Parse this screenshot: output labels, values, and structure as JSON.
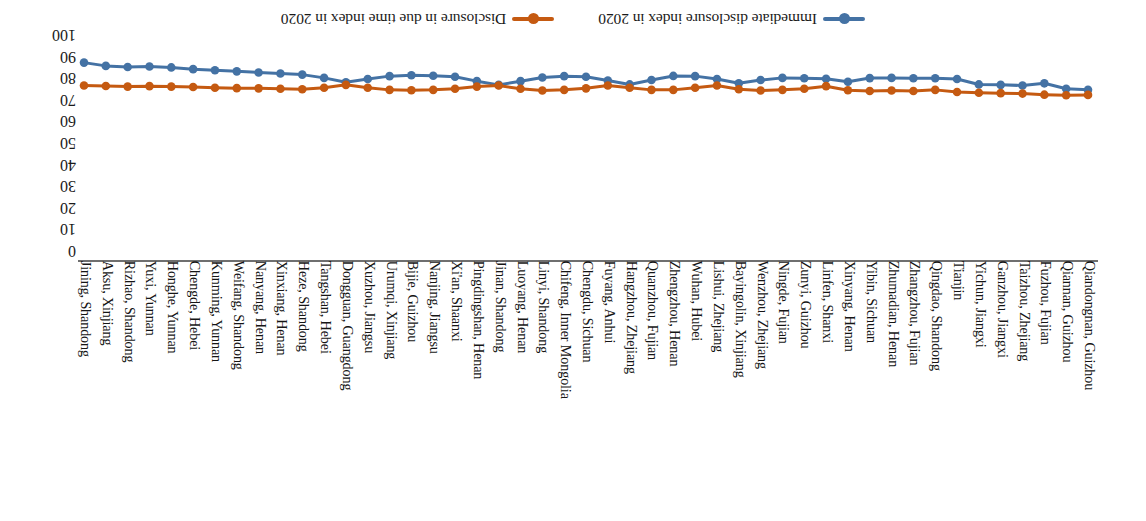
{
  "figure": {
    "rotation_degrees": 180,
    "background": "#ffffff"
  },
  "legend": {
    "position": "bottom",
    "entries": [
      {
        "label": "Immediate disclosure index in 2020",
        "color": "#4472A4",
        "marker": "circle-line-marker"
      },
      {
        "label": "Disclosure in due time index in 2020",
        "color": "#C55A11",
        "marker": "circle-line-marker"
      }
    ]
  },
  "axes": {
    "y": {
      "ticks": [
        "0",
        "10",
        "20",
        "30",
        "40",
        "50",
        "60",
        "70",
        "80",
        "90",
        "100"
      ],
      "min": 0,
      "max": 100,
      "step": 10,
      "position": "right",
      "label": ""
    },
    "x": {
      "label": "",
      "grid": false
    }
  },
  "chart_data": {
    "type": "line",
    "title": "",
    "xlabel": "",
    "ylabel": "",
    "ylim": [
      0,
      100
    ],
    "grid": false,
    "legend_position": "bottom",
    "categories": [
      "Qiandongnan, Guizhou",
      "Qiannan, Guizhou",
      "Fuzhou, Fujian",
      "Taizhou, Zhejiang",
      "Ganzhou, Jiangxi",
      "Yichun, Jiangxi",
      "Tianjin",
      "Qingdao, Shandong",
      "Zhangzhou, Fujian",
      "Zhumadian, Henan",
      "Yibin, Sichuan",
      "Xinyang, Henan",
      "Linfen, Shanxi",
      "Zunyi, Guizhou",
      "Ningde, Fujian",
      "Wenzhou, Zhejiang",
      "Bayingolin, Xinjiang",
      "Lishui, Zhejiang",
      "Wuhan, Hubei",
      "Zhengzhou, Henan",
      "Quanzhou, Fujian",
      "Hangzhou, Zhejiang",
      "Fuyang, Anhui",
      "Chengdu, Sichuan",
      "Chifeng, Inner Mongolia",
      "Linyi, Shandong",
      "Luoyang, Henan",
      "Jinan, Shandong",
      "Pingdingshan, Henan",
      "Xi'an, Shaanxi",
      "Nanjing, Jiangsu",
      "Bijie, Guizhou",
      "Urumqi, Xinjiang",
      "Xuzhou, Jiangsu",
      "Dongguan, Guangdong",
      "Tangshan, Hebei",
      "Heze, Shandong",
      "Xinxiang, Henan",
      "Nanyang, Henan",
      "Weifang, Shandong",
      "Kunming, Yunnan",
      "Chengde, Hebei",
      "Honghe, Yunnan",
      "Yuxi, Yunnan",
      "Rizhao, Shandong",
      "Aksu, Xinjiang",
      "Jining, Shandong"
    ],
    "series": [
      {
        "name": "Immediate disclosure index in 2020",
        "color": "#4472A4",
        "values": [
          78.5,
          79.0,
          81.5,
          80.5,
          80.8,
          81.0,
          83.5,
          83.8,
          83.8,
          84.0,
          83.9,
          82.2,
          83.6,
          83.8,
          84.0,
          83.0,
          81.5,
          83.5,
          84.8,
          84.9,
          83.0,
          81.0,
          82.8,
          84.5,
          84.8,
          84.2,
          82.5,
          80.8,
          82.5,
          84.5,
          85.0,
          85.2,
          84.8,
          83.5,
          82.0,
          84.0,
          85.5,
          86.0,
          86.5,
          87.0,
          87.5,
          88.0,
          88.8,
          89.2,
          89.0,
          89.5,
          91.0
        ]
      },
      {
        "name": "Disclosure in due time index in 2020",
        "color": "#C55A11",
        "values": [
          76.2,
          76.0,
          76.3,
          76.8,
          77.0,
          77.2,
          77.5,
          78.5,
          78.0,
          78.2,
          78.0,
          78.3,
          80.2,
          79.0,
          78.5,
          78.2,
          78.8,
          80.5,
          79.5,
          78.5,
          78.5,
          79.5,
          80.5,
          79.2,
          78.5,
          78.2,
          79.0,
          80.5,
          80.0,
          79.0,
          78.5,
          78.3,
          78.5,
          79.5,
          80.8,
          79.5,
          78.8,
          79.0,
          79.2,
          79.3,
          79.5,
          79.8,
          80.0,
          80.2,
          80.0,
          80.3,
          80.5
        ]
      }
    ]
  }
}
